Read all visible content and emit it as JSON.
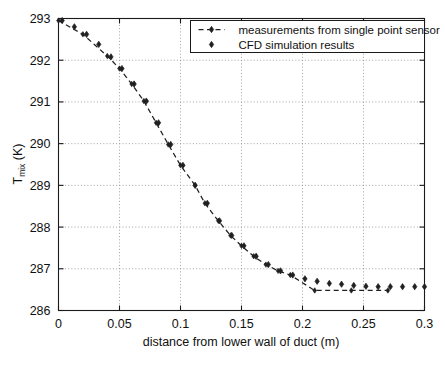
{
  "chart_data": {
    "type": "scatter",
    "title": "",
    "xlabel": "distance from lower wall of duct (m)",
    "ylabel": "T_mix (K)",
    "ylabel_main": "T",
    "ylabel_subscript": "mix",
    "ylabel_units": " (K)",
    "xlim": [
      0,
      0.3
    ],
    "ylim": [
      286,
      293
    ],
    "xticks": [
      0,
      0.05,
      0.1,
      0.15,
      0.2,
      0.25,
      0.3
    ],
    "xtick_labels": [
      "0",
      "0.05",
      "0.1",
      "0.15",
      "0.2",
      "0.25",
      "0.3"
    ],
    "yticks": [
      286,
      287,
      288,
      289,
      290,
      291,
      292,
      293
    ],
    "ytick_labels": [
      "286",
      "287",
      "288",
      "289",
      "290",
      "291",
      "292",
      "293"
    ],
    "grid": true,
    "grid_style": "dotted",
    "legend_position": "top-right",
    "series": [
      {
        "name": "measurements from single point sensor",
        "style": "dashed-line-with-marker",
        "marker": "diamond",
        "color": "#202020",
        "x": [
          0.0,
          0.02,
          0.04,
          0.05,
          0.06,
          0.07,
          0.08,
          0.09,
          0.1,
          0.112,
          0.12,
          0.131,
          0.141,
          0.15,
          0.16,
          0.17,
          0.18,
          0.19,
          0.21,
          0.24,
          0.27
        ],
        "y": [
          292.95,
          292.62,
          292.1,
          291.8,
          291.43,
          291.02,
          290.5,
          289.98,
          289.48,
          289.0,
          288.57,
          288.15,
          287.8,
          287.55,
          287.3,
          287.1,
          286.95,
          286.85,
          286.48,
          286.48,
          286.48
        ]
      },
      {
        "name": "CFD simulation results",
        "style": "marker-only",
        "marker": "diamond",
        "color": "#202020",
        "x": [
          0.003,
          0.013,
          0.023,
          0.033,
          0.043,
          0.052,
          0.062,
          0.072,
          0.082,
          0.092,
          0.102,
          0.112,
          0.122,
          0.132,
          0.142,
          0.152,
          0.162,
          0.172,
          0.182,
          0.192,
          0.202,
          0.212,
          0.222,
          0.232,
          0.242,
          0.252,
          0.262,
          0.272,
          0.282,
          0.292,
          0.3
        ],
        "y": [
          292.95,
          292.8,
          292.62,
          292.38,
          292.08,
          291.8,
          291.43,
          291.02,
          290.5,
          289.98,
          289.48,
          289.0,
          288.57,
          288.15,
          287.8,
          287.55,
          287.3,
          287.1,
          286.95,
          286.85,
          286.76,
          286.7,
          286.65,
          286.63,
          286.6,
          286.58,
          286.57,
          286.57,
          286.57,
          286.57,
          286.57
        ]
      }
    ]
  },
  "legend": {
    "entries": [
      {
        "label": "measurements from single point sensor",
        "style": "dashed-line-with-marker"
      },
      {
        "label": "CFD simulation results",
        "style": "marker-only"
      }
    ]
  },
  "colors": {
    "background": "#ffffff",
    "axis": "#1a1a1a",
    "grid": "#8a8a8a",
    "data": "#202020"
  }
}
